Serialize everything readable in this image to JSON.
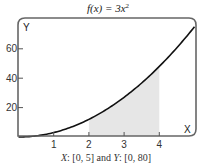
{
  "chart_data": {
    "type": "line",
    "title_parts": {
      "prefix": "f(x) = 3x",
      "exponent": "2"
    },
    "function": "3*x^2",
    "x": [
      0,
      0.5,
      1,
      1.5,
      2,
      2.5,
      3,
      3.5,
      4,
      4.5,
      5
    ],
    "series": [
      {
        "name": "f(x) = 3x^2",
        "values": [
          0,
          0.75,
          3,
          6.75,
          12,
          18.75,
          27,
          36.75,
          48,
          60.75,
          75
        ],
        "color": "#111111"
      }
    ],
    "shaded_region": {
      "x_from": 2,
      "x_to": 4,
      "color": "#e6e6e6"
    },
    "xlabel": "X",
    "ylabel": "Y",
    "xlim": [
      0,
      5
    ],
    "ylim": [
      0,
      80
    ],
    "x_ticks": [
      1,
      2,
      3,
      4
    ],
    "y_ticks": [
      20,
      40,
      60
    ],
    "x_tick_labels": [
      "1",
      "2",
      "3",
      "4"
    ],
    "y_tick_labels": [
      "20",
      "40",
      "60"
    ],
    "grid": false,
    "caption": "X: [0, 5] and Y: [0, 80]",
    "caption_parts": {
      "x_var": "X",
      "x_range": ": [0, 5] and ",
      "y_var": "Y",
      "y_range": ": [0, 80]"
    },
    "frame_color": "#666666"
  }
}
